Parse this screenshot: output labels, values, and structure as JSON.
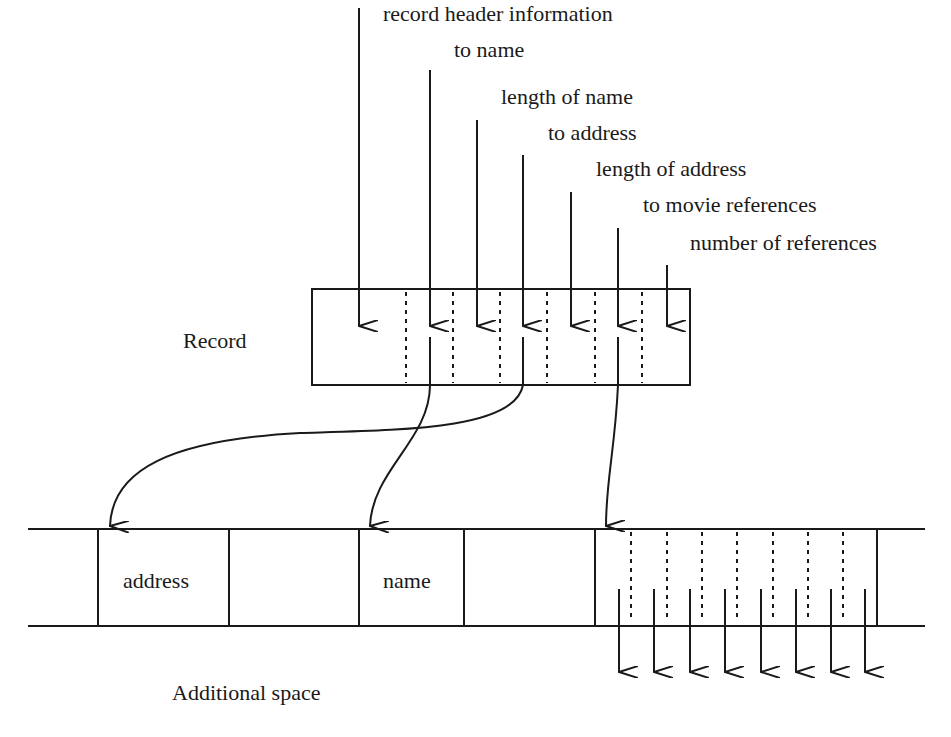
{
  "diagram": {
    "record_label": "Record",
    "additional_space_label": "Additional space",
    "field_labels": [
      "record header information",
      "to name",
      "length of name",
      "to address",
      "length of address",
      "to movie references",
      "number of references"
    ],
    "cells": {
      "address": "address",
      "name": "name"
    },
    "movie_reference_arrow_count": 8
  }
}
